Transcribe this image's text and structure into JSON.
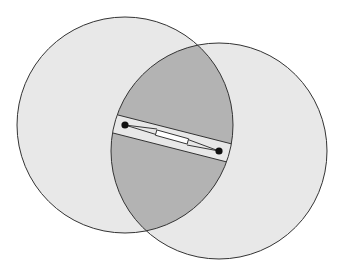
{
  "diagram": {
    "width": 342,
    "height": 273,
    "background": "#ffffff",
    "colors": {
      "circle_fill": "#e8e8e8",
      "lens_fill": "#b3b3b3",
      "stroke": "#333333",
      "dot": "#111111",
      "bar_fill": "#ffffff",
      "link_stroke": "#222222"
    },
    "circles": [
      {
        "id": "left",
        "cx": 125,
        "cy": 125,
        "r": 108
      },
      {
        "id": "right",
        "cx": 219,
        "cy": 151,
        "r": 108
      }
    ],
    "circle_intersections": {
      "top": [
        197,
        44
      ],
      "bottom": [
        147,
        232
      ]
    },
    "gap_band": {
      "upper_line": [
        [
          118,
          115
        ],
        [
          232,
          144
        ]
      ],
      "lower_line": [
        [
          113,
          133
        ],
        [
          227,
          162
        ]
      ]
    },
    "center_dots": [
      {
        "cx": 125,
        "cy": 125,
        "r": 3.6
      },
      {
        "cx": 219,
        "cy": 151,
        "r": 3.6
      }
    ],
    "bar": {
      "cx": 172,
      "cy": 137,
      "length": 33,
      "thickness": 5.5,
      "angle_deg": 15.5
    },
    "links": [
      {
        "from": [
          125,
          125
        ],
        "to": [
          157,
          129
        ]
      },
      {
        "from": [
          125,
          125
        ],
        "to": [
          156,
          134.5
        ]
      },
      {
        "from": [
          219,
          151
        ],
        "to": [
          188,
          139.5
        ]
      },
      {
        "from": [
          219,
          151
        ],
        "to": [
          187,
          145
        ]
      }
    ]
  }
}
